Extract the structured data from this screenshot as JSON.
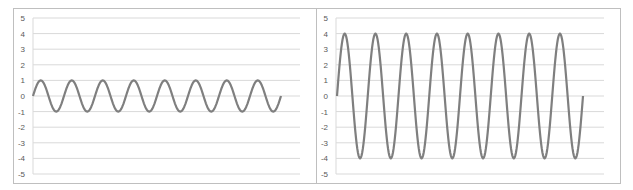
{
  "chart_data": [
    {
      "type": "line",
      "title": "",
      "xlabel": "",
      "ylabel": "",
      "ylim": [
        -5,
        5
      ],
      "yticks": [
        "5",
        "4",
        "3",
        "2",
        "1",
        "0",
        "-1",
        "-2",
        "-3",
        "-4",
        "-5"
      ],
      "grid": true,
      "legend": "none",
      "series": [
        {
          "name": "sine",
          "amplitude": 1,
          "cycles": 8,
          "color": "#7f7f7f"
        }
      ]
    },
    {
      "type": "line",
      "title": "",
      "xlabel": "",
      "ylabel": "",
      "ylim": [
        -5,
        5
      ],
      "yticks": [
        "5",
        "4",
        "3",
        "2",
        "1",
        "0",
        "-1",
        "-2",
        "-3",
        "-4",
        "-5"
      ],
      "grid": true,
      "legend": "none",
      "series": [
        {
          "name": "sine",
          "amplitude": 4,
          "cycles": 8,
          "color": "#7f7f7f"
        }
      ]
    }
  ],
  "layout": {
    "panels": [
      {
        "frame": [
          13,
          8,
          303,
          176
        ],
        "plot_left": 33,
        "plot_right": 300,
        "y_top": 18,
        "y_bottom": 174,
        "wave_x0": 33,
        "wave_x1": 281
      },
      {
        "frame": [
          316,
          8,
          305,
          176
        ],
        "plot_left": 336,
        "plot_right": 604,
        "y_top": 18,
        "y_bottom": 174,
        "wave_x0": 337,
        "wave_x1": 583
      }
    ],
    "colors": {
      "grid": "#d9d9d9",
      "frame": "#bfbfbf",
      "line": "#7f7f7f",
      "tick": "#595959"
    }
  }
}
